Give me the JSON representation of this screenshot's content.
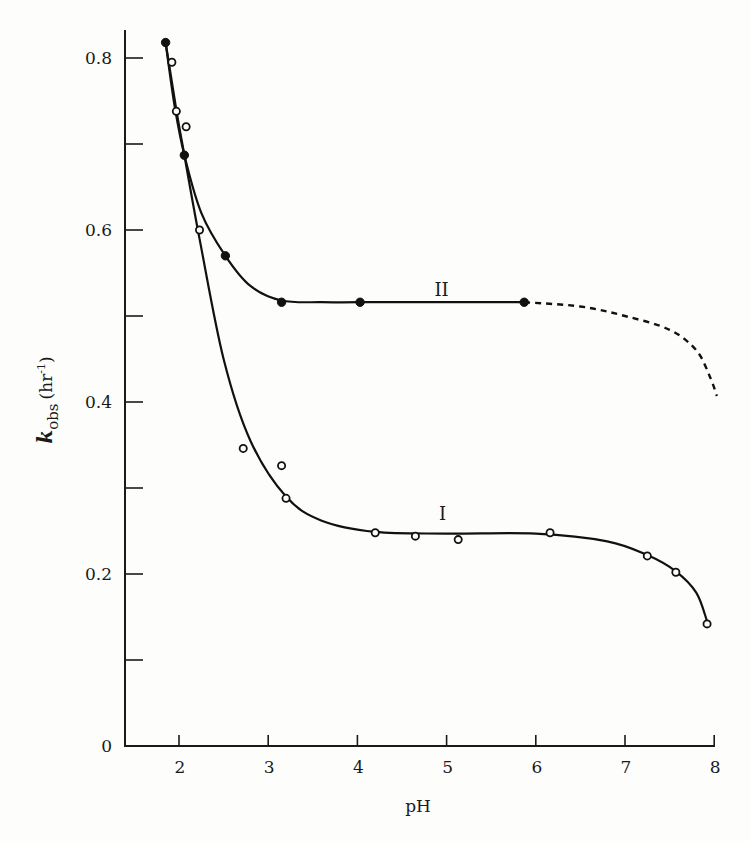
{
  "chart_data": {
    "type": "line",
    "title": "",
    "xlabel": "pH",
    "ylabel": "k_obs (hr^-1)",
    "ylabel_parts": {
      "symbol": "k",
      "subscript": "obs",
      "unit": "(hr",
      "unit_exp": "-1",
      "unit_close": ")"
    },
    "xlim": [
      1.47,
      8.0
    ],
    "ylim": [
      0,
      0.83
    ],
    "x_ticks": [
      2,
      3,
      4,
      5,
      6,
      7,
      8
    ],
    "x_tick_labels": [
      "2",
      "3",
      "4",
      "5",
      "6",
      "7",
      "8"
    ],
    "y_ticks": [
      0,
      0.1,
      0.2,
      0.3,
      0.4,
      0.5,
      0.6,
      0.7,
      0.8
    ],
    "y_tick_labels": [
      "0",
      "",
      "0.2",
      "",
      "0.4",
      "",
      "0.6",
      "",
      "0.8"
    ],
    "grid": false,
    "legend": "none (inline labels)",
    "series": [
      {
        "name": "I",
        "marker": "open-circle",
        "label_pos": [
          5.0,
          0.27
        ],
        "points": [
          [
            1.92,
            0.795
          ],
          [
            1.97,
            0.738
          ],
          [
            2.08,
            0.72
          ],
          [
            2.23,
            0.6
          ],
          [
            2.72,
            0.346
          ],
          [
            3.15,
            0.326
          ],
          [
            3.2,
            0.288
          ],
          [
            4.2,
            0.248
          ],
          [
            4.65,
            0.244
          ],
          [
            5.13,
            0.24
          ],
          [
            6.16,
            0.248
          ],
          [
            7.25,
            0.221
          ],
          [
            7.57,
            0.202
          ],
          [
            7.92,
            0.142
          ]
        ],
        "fit_curve": [
          [
            1.85,
            0.818
          ],
          [
            1.97,
            0.74
          ],
          [
            2.06,
            0.687
          ],
          [
            2.23,
            0.59
          ],
          [
            2.5,
            0.45
          ],
          [
            2.8,
            0.355
          ],
          [
            3.2,
            0.29
          ],
          [
            3.6,
            0.262
          ],
          [
            4.2,
            0.249
          ],
          [
            5.0,
            0.247
          ],
          [
            6.0,
            0.247
          ],
          [
            6.8,
            0.238
          ],
          [
            7.25,
            0.222
          ],
          [
            7.57,
            0.203
          ],
          [
            7.8,
            0.178
          ],
          [
            7.92,
            0.145
          ]
        ]
      },
      {
        "name": "II",
        "marker": "filled-circle",
        "label_pos": [
          5.0,
          0.53
        ],
        "points": [
          [
            1.85,
            0.818
          ],
          [
            2.06,
            0.687
          ],
          [
            2.52,
            0.57
          ],
          [
            3.15,
            0.516
          ],
          [
            4.03,
            0.516
          ],
          [
            5.87,
            0.516
          ]
        ],
        "fit_curve": [
          [
            1.85,
            0.818
          ],
          [
            1.95,
            0.745
          ],
          [
            2.06,
            0.687
          ],
          [
            2.25,
            0.62
          ],
          [
            2.52,
            0.57
          ],
          [
            2.8,
            0.535
          ],
          [
            3.15,
            0.518
          ],
          [
            3.6,
            0.516
          ],
          [
            4.03,
            0.516
          ],
          [
            5.0,
            0.516
          ],
          [
            5.87,
            0.516
          ]
        ],
        "extrapolated_dashed": [
          [
            5.87,
            0.516
          ],
          [
            6.5,
            0.511
          ],
          [
            7.0,
            0.5
          ],
          [
            7.5,
            0.484
          ],
          [
            7.8,
            0.46
          ],
          [
            7.95,
            0.43
          ],
          [
            8.03,
            0.407
          ]
        ]
      }
    ]
  }
}
